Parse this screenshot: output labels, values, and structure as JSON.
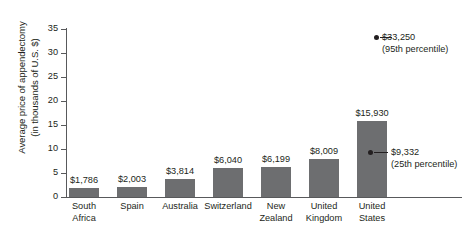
{
  "chart_data": {
    "type": "bar",
    "title": "",
    "xlabel": "",
    "ylabel_line1": "Average price of appendectomy",
    "ylabel_line2": "(in thousands of U.S. $)",
    "ylim": [
      0,
      35
    ],
    "ytick_labels": [
      "0",
      "5",
      "10",
      "15",
      "20",
      "25",
      "30",
      "35"
    ],
    "ytick_values": [
      0,
      5,
      10,
      15,
      20,
      25,
      30,
      35
    ],
    "grid": false,
    "legend": "none",
    "categories": [
      "South Africa",
      "Spain",
      "Australia",
      "Switzerland",
      "New Zealand",
      "United Kingdom",
      "United States"
    ],
    "category_lines": [
      [
        "South",
        "Africa"
      ],
      [
        "Spain"
      ],
      [
        "Australia"
      ],
      [
        "Switzerland"
      ],
      [
        "New",
        "Zealand"
      ],
      [
        "United",
        "Kingdom"
      ],
      [
        "United",
        "States"
      ]
    ],
    "values": [
      1786,
      2003,
      3814,
      6040,
      6199,
      8009,
      15930
    ],
    "value_labels": [
      "$1,786",
      "$2,003",
      "$3,814",
      "$6,040",
      "$6,199",
      "$8,009",
      "$15,930"
    ],
    "annotations": [
      {
        "id": "p95",
        "value": 33250,
        "label": "$33,250",
        "sublabel": "(95th percentile)",
        "attached_to": "United States"
      },
      {
        "id": "p25",
        "value": 9332,
        "label": "$9,332",
        "sublabel": "(25th percentile)",
        "attached_to": "United States"
      }
    ],
    "bar_color": "#6d6e70",
    "axis_color": "#58595b",
    "text_color": "#231f20"
  },
  "caption": {
    "cropped_line": "source line cropped"
  }
}
